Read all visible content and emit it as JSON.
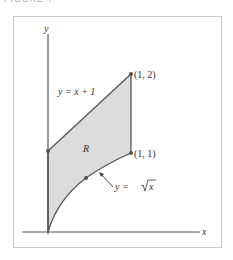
{
  "figure": {
    "caption": "FIGURE 7",
    "x_axis_label": "x",
    "y_axis_label": "y",
    "region_label": "R",
    "curve_labels": {
      "line": "y = x + 1",
      "sqrt_prefix": "y = ",
      "sqrt_radicand": "x"
    },
    "point_labels": {
      "top_right": "(1, 2)",
      "bottom_right": "(1, 1)"
    },
    "colors": {
      "fill": "#dcdcdc",
      "stroke": "#555555",
      "frame": "#c8c8c8"
    }
  }
}
